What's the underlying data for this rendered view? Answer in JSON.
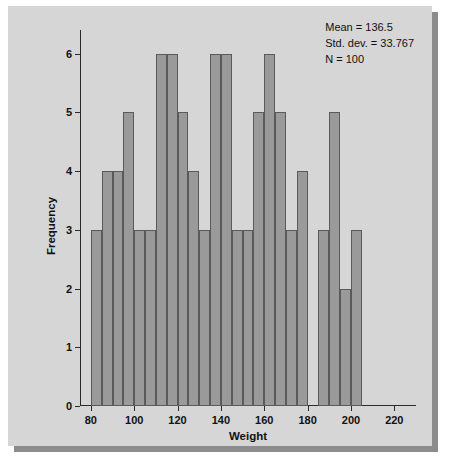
{
  "chart_data": {
    "type": "bar",
    "title": "",
    "xlabel": "Weight",
    "ylabel": "Frequency",
    "xlim": [
      75,
      230
    ],
    "ylim": [
      0,
      6.4
    ],
    "grid": false,
    "legend": null,
    "bin_width": 5,
    "bin_starts": [
      80,
      85,
      90,
      95,
      100,
      105,
      110,
      115,
      120,
      125,
      130,
      135,
      140,
      145,
      150,
      155,
      160,
      165,
      170,
      175,
      180,
      185,
      190,
      195,
      200
    ],
    "categories": [
      "80-85",
      "85-90",
      "90-95",
      "95-100",
      "100-105",
      "105-110",
      "110-115",
      "115-120",
      "120-125",
      "125-130",
      "130-135",
      "135-140",
      "140-145",
      "145-150",
      "150-155",
      "155-160",
      "160-165",
      "165-170",
      "170-175",
      "175-180",
      "180-185",
      "185-190",
      "190-195",
      "195-200",
      "200-205"
    ],
    "values": [
      3,
      4,
      4,
      5,
      3,
      3,
      6,
      6,
      5,
      4,
      3,
      6,
      6,
      3,
      3,
      5,
      6,
      5,
      3,
      4,
      0,
      3,
      5,
      2,
      3
    ],
    "xticks": [
      80,
      100,
      120,
      140,
      160,
      180,
      200,
      220
    ],
    "xtick_labels": [
      "80",
      "100",
      "120",
      "140",
      "160",
      "180",
      "200",
      "220"
    ],
    "yticks": [
      0,
      1,
      2,
      3,
      4,
      5,
      6
    ],
    "ytick_labels": [
      "0",
      "1",
      "2",
      "3",
      "4",
      "5",
      "6"
    ],
    "annotations": {
      "mean": "Mean = 136.5",
      "std_dev": "Std. dev. = 33.767",
      "n": "N = 100"
    },
    "colors": {
      "bar_fill": "#9a9a9a",
      "bar_edge": "#5a5a5a",
      "panel_background": "#d6d6d6",
      "axis": "#2b2b2b",
      "text": "#111111"
    }
  }
}
